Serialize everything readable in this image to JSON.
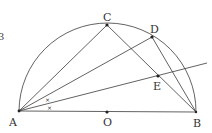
{
  "figure": {
    "points": {
      "A": {
        "label": "A"
      },
      "O": {
        "label": "O"
      },
      "B": {
        "label": "B"
      },
      "C": {
        "label": "C"
      },
      "D": {
        "label": "D"
      },
      "E": {
        "label": "E"
      }
    },
    "segments": [
      "AB",
      "AC",
      "AD",
      "CB",
      "DB",
      "AE-ray"
    ],
    "angle_marks": {
      "symbol": "×",
      "count": 2,
      "meaning": "angle DAE = angle EAB"
    },
    "edge_fragment": "3",
    "colors": {
      "stroke": "#3a3a3a",
      "background": "#ffffff"
    }
  }
}
